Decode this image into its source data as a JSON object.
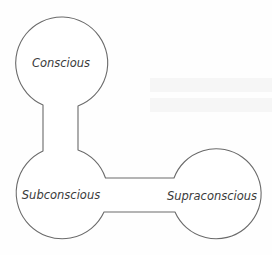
{
  "diagram": {
    "nodes": [
      {
        "id": "conscious",
        "label": "Conscious",
        "cx": 62,
        "cy": 63,
        "r": 46
      },
      {
        "id": "subconscious",
        "label": "Subconscious",
        "cx": 62,
        "cy": 193,
        "r": 46
      },
      {
        "id": "supraconscious",
        "label": "Supraconscious",
        "cx": 216,
        "cy": 194,
        "r": 45
      }
    ],
    "connections": [
      {
        "from": "conscious",
        "to": "subconscious",
        "type": "vertical-neck"
      },
      {
        "from": "subconscious",
        "to": "supraconscious",
        "type": "horizontal-bar"
      }
    ],
    "labels": {
      "conscious": "Conscious",
      "subconscious": "Subconscious",
      "supraconscious": "Supraconscious"
    },
    "colors": {
      "stroke": "#6a6a6a",
      "text": "#3a3a3a",
      "fill": "#ffffff",
      "background": "#fefefe"
    }
  }
}
